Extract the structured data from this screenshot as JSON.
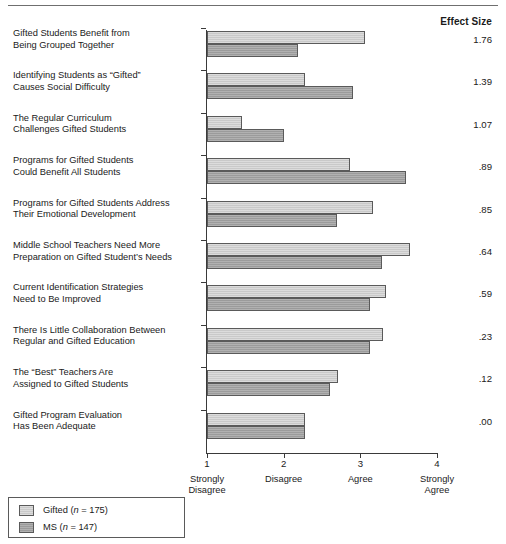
{
  "header": {
    "effect_size_label": "Effect Size"
  },
  "axis": {
    "ticks": [
      {
        "value": 1,
        "num": "1",
        "line1": "Strongly",
        "line2": "Disagree"
      },
      {
        "value": 2,
        "num": "2",
        "line1": "Disagree",
        "line2": ""
      },
      {
        "value": 3,
        "num": "3",
        "line1": "Agree",
        "line2": ""
      },
      {
        "value": 4,
        "num": "4",
        "line1": "Strongly",
        "line2": "Agree"
      }
    ]
  },
  "legend": {
    "items": [
      {
        "key": "gifted",
        "label": "Gifted (n = 175)",
        "name": "Gifted",
        "n": "175",
        "color": "#c9c9c9"
      },
      {
        "key": "ms",
        "label": "MS (n = 147)",
        "name": "MS",
        "n": "147",
        "color": "#9b9b9b"
      }
    ]
  },
  "chart_data": {
    "type": "bar",
    "orientation": "horizontal",
    "title": "",
    "xlabel": "",
    "ylabel": "",
    "xlim": [
      1,
      4
    ],
    "grid": false,
    "legend_position": "bottom-left",
    "xtick_labels": [
      "1",
      "2",
      "3",
      "4"
    ],
    "xtick_text": [
      "Strongly Disagree",
      "Disagree",
      "Agree",
      "Strongly Agree"
    ],
    "categories": [
      "Gifted Students Benefit from Being Grouped Together",
      "Identifying Students as “Gifted” Causes Social Difficulty",
      "The Regular Curriculum Challenges Gifted Students",
      "Programs for Gifted Students Could Benefit All Students",
      "Programs for Gifted Students Address Their Emotional Development",
      "Middle School Teachers Need More Preparation on Gifted Student’s Needs",
      "Current Identification Strategies Need to Be Improved",
      "There Is Little Collaboration Between Regular and Gifted Education",
      "The “Best” Teachers Are Assigned to Gifted Students",
      "Gifted Program Evaluation Has Been Adequate"
    ],
    "category_lines": [
      [
        "Gifted Students Benefit from",
        "Being Grouped Together"
      ],
      [
        "Identifying Students as “Gifted”",
        "Causes Social Difficulty"
      ],
      [
        "The Regular Curriculum",
        "Challenges Gifted Students"
      ],
      [
        "Programs for Gifted Students",
        "Could Benefit All Students"
      ],
      [
        "Programs for Gifted Students Address",
        "Their Emotional Development"
      ],
      [
        "Middle School Teachers Need More",
        "Preparation on Gifted Student’s Needs"
      ],
      [
        "Current Identification Strategies",
        "Need to Be Improved"
      ],
      [
        "There Is Little Collaboration Between",
        "Regular and Gifted Education"
      ],
      [
        "The “Best” Teachers Are",
        "Assigned to Gifted Students"
      ],
      [
        "Gifted Program Evaluation",
        "Has Been Adequate"
      ]
    ],
    "series": [
      {
        "name": "Gifted (n = 175)",
        "key": "gifted",
        "color": "#c9c9c9",
        "values": [
          3.06,
          2.28,
          1.46,
          2.87,
          3.16,
          3.65,
          3.34,
          3.3,
          2.71,
          2.28
        ]
      },
      {
        "name": "MS (n = 147)",
        "key": "ms",
        "color": "#9b9b9b",
        "values": [
          2.19,
          2.9,
          2.0,
          3.59,
          2.7,
          3.28,
          3.12,
          3.12,
          2.6,
          2.28
        ]
      }
    ],
    "effect_sizes": [
      "1.76",
      "1.39",
      "1.07",
      ".89",
      ".85",
      ".64",
      ".59",
      ".23",
      ".12",
      ".00"
    ]
  }
}
